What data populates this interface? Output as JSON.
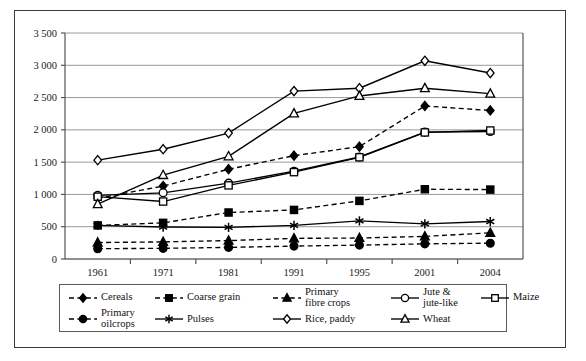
{
  "chart_data": {
    "type": "line",
    "title": "",
    "subtitle": "",
    "xlabel": "",
    "ylabel": "",
    "categories": [
      "1961",
      "1971",
      "1981",
      "1991",
      "1995",
      "2001",
      "2004"
    ],
    "ylim": [
      0,
      3500
    ],
    "yticks": [
      0,
      500,
      1000,
      1500,
      2000,
      2500,
      3000,
      3500
    ],
    "ytick_labels": [
      "0",
      "500",
      "1 000",
      "1 500",
      "2 000",
      "2 500",
      "3 000",
      "3 500"
    ],
    "grid": "horizontal",
    "legend_position": "bottom",
    "series": [
      {
        "name": "Cereals",
        "marker": "diamond-filled",
        "line": "dashed",
        "values": [
          940,
          1130,
          1390,
          1600,
          1740,
          2370,
          2300
        ]
      },
      {
        "name": "Coarse grain",
        "marker": "square-filled",
        "line": "dashed",
        "values": [
          520,
          560,
          720,
          760,
          900,
          1080,
          1075
        ]
      },
      {
        "name": "Primary fibre crops",
        "marker": "triangle-filled",
        "line": "dashed",
        "values": [
          255,
          265,
          285,
          320,
          325,
          350,
          405
        ]
      },
      {
        "name": "Jute & jute-like",
        "marker": "circle-open",
        "line": "solid",
        "values": [
          985,
          1025,
          1175,
          1360,
          1580,
          1965,
          1975
        ]
      },
      {
        "name": "Maize",
        "marker": "square-open",
        "line": "solid",
        "values": [
          965,
          890,
          1140,
          1345,
          1575,
          1960,
          1990
        ]
      },
      {
        "name": "Primary oilcrops",
        "marker": "circle-filled",
        "line": "dashed",
        "values": [
          160,
          165,
          180,
          200,
          215,
          235,
          245
        ]
      },
      {
        "name": "Pulses",
        "marker": "asterisk",
        "line": "solid",
        "values": [
          520,
          495,
          490,
          520,
          590,
          545,
          580
        ]
      },
      {
        "name": "Rice, paddy",
        "marker": "diamond-open",
        "line": "solid",
        "values": [
          1530,
          1700,
          1950,
          2600,
          2645,
          3070,
          2880
        ]
      },
      {
        "name": "Wheat",
        "marker": "triangle-open",
        "line": "solid",
        "values": [
          850,
          1300,
          1590,
          2255,
          2525,
          2645,
          2560
        ]
      }
    ]
  },
  "legend": {
    "items": [
      {
        "label": "Cereals",
        "marker": "diamond-filled",
        "line": "dashed"
      },
      {
        "label": "Coarse grain",
        "marker": "square-filled",
        "line": "dashed"
      },
      {
        "label": "Primary\nfibre crops",
        "marker": "triangle-filled",
        "line": "dashed"
      },
      {
        "label": "Jute &\njute-like",
        "marker": "circle-open",
        "line": "solid"
      },
      {
        "label": "Maize",
        "marker": "square-open",
        "line": "solid"
      },
      {
        "label": "Primary\noilcrops",
        "marker": "circle-filled",
        "line": "dashed"
      },
      {
        "label": "Pulses",
        "marker": "asterisk",
        "line": "solid"
      },
      {
        "label": "Rice, paddy",
        "marker": "diamond-open",
        "line": "solid"
      },
      {
        "label": "Wheat",
        "marker": "triangle-open",
        "line": "solid"
      }
    ]
  },
  "colors": {
    "line": "#000000",
    "grid": "#9a9a9a",
    "axis": "#555555",
    "frame": "#3a3a3a",
    "text": "#111111",
    "background": "#ffffff"
  }
}
